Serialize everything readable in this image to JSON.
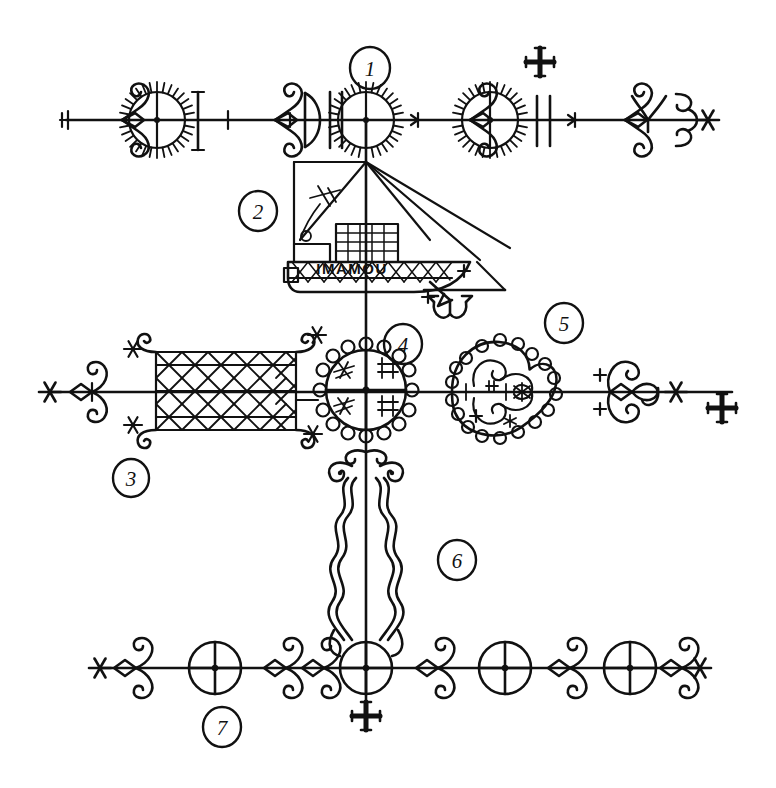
{
  "image": {
    "title": "Vèvè composite drawing",
    "description": "Hand-drawn Haitian Vodou vèvè: three horizontal ritual axes crossed by one vertical axis, with numbered reference labels 1-7",
    "background_color": "#ffffff",
    "ink_color": "#111111",
    "width": 776,
    "height": 788
  },
  "labels": [
    {
      "id": "label-1",
      "text": "1",
      "x": 370,
      "y": 68,
      "note": "top axis / crossing point"
    },
    {
      "id": "label-2",
      "text": "2",
      "x": 258,
      "y": 211,
      "note": "ship Imamou"
    },
    {
      "id": "label-3",
      "text": "3",
      "x": 131,
      "y": 478,
      "note": "cross-hatched rectangle"
    },
    {
      "id": "label-4",
      "text": "4",
      "x": 403,
      "y": 344,
      "note": "scalloped quartered circle"
    },
    {
      "id": "label-5",
      "text": "5",
      "x": 564,
      "y": 323,
      "note": "scalloped heart"
    },
    {
      "id": "label-6",
      "text": "6",
      "x": 457,
      "y": 560,
      "note": "paired serpents"
    },
    {
      "id": "label-7",
      "text": "7",
      "x": 222,
      "y": 727,
      "note": "bottom axis"
    }
  ],
  "inscriptions": [
    {
      "id": "ship-hull-name",
      "text": "IMAMOU",
      "location": "ship hull",
      "x": 352,
      "y": 274
    }
  ],
  "axes": [
    {
      "id": "top-axis",
      "orientation": "horizontal",
      "y": 120,
      "x1": 62,
      "x2": 714
    },
    {
      "id": "middle-axis",
      "orientation": "horizontal",
      "y": 392,
      "x1": 44,
      "x2": 736
    },
    {
      "id": "bottom-axis",
      "orientation": "horizontal",
      "y": 668,
      "x1": 96,
      "x2": 704
    },
    {
      "id": "vertical-axis",
      "orientation": "vertical",
      "x": 366,
      "y1": 120,
      "y2": 700
    }
  ],
  "motifs": [
    {
      "id": "spoked-sun-disc",
      "name": "rayed sun disc",
      "count": 3,
      "axis": "top"
    },
    {
      "id": "curl-volute",
      "name": "double curl volute",
      "axis": "top"
    },
    {
      "id": "crescent-bars",
      "name": "crescent and double bars",
      "axis": "top"
    },
    {
      "id": "cross-pattee",
      "name": "cross pattée",
      "count": 3
    },
    {
      "id": "ship-imamou",
      "name": "sailing ship Imamou with anchor",
      "axis": "vertical"
    },
    {
      "id": "lattice-box",
      "name": "cross-hatched lattice rectangle",
      "axis": "middle"
    },
    {
      "id": "quartered-disc",
      "name": "scalloped quartered disc with four marks",
      "axis": "middle"
    },
    {
      "id": "scalloped-heart",
      "name": "scalloped heart with interior volutes",
      "axis": "middle"
    },
    {
      "id": "twin-serpents",
      "name": "twin wavy serpents",
      "axis": "vertical"
    },
    {
      "id": "crossed-circle",
      "name": "quartered circle",
      "count": 4,
      "axis": "bottom"
    },
    {
      "id": "star-asterisk",
      "name": "six-ray star terminal",
      "count": 6
    }
  ]
}
